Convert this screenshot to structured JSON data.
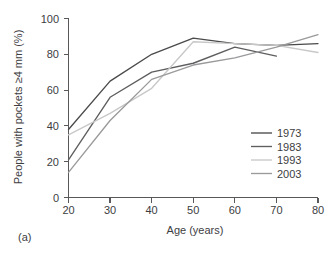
{
  "figure": {
    "panel_label": "(a)"
  },
  "chart_data": {
    "type": "line",
    "title": "",
    "xlabel": "Age (years)",
    "ylabel": "People with pockets ≥4 mm (%)",
    "x": [
      20,
      30,
      40,
      50,
      60,
      70,
      80
    ],
    "xlim": [
      20,
      80
    ],
    "ylim": [
      0,
      100
    ],
    "xticks": [
      20,
      30,
      40,
      50,
      60,
      70,
      80
    ],
    "yticks": [
      0,
      20,
      40,
      60,
      80,
      100
    ],
    "xtick_labels": [
      "20",
      "30",
      "40",
      "50",
      "60",
      "70",
      "80"
    ],
    "ytick_labels": [
      "0",
      "20",
      "40",
      "60",
      "80",
      "100"
    ],
    "grid": false,
    "legend_position": "right-center",
    "series": [
      {
        "name": "1973",
        "color": "#4a4a4c",
        "x": [
          20,
          30,
          40,
          50,
          60,
          70,
          80
        ],
        "values": [
          38,
          65,
          80,
          89,
          86,
          85,
          86
        ]
      },
      {
        "name": "1983",
        "color": "#5e5e60",
        "x": [
          20,
          30,
          40,
          50,
          60,
          70
        ],
        "values": [
          21,
          56,
          70,
          75,
          84,
          79
        ]
      },
      {
        "name": "1993",
        "color": "#c8c8c8",
        "x": [
          20,
          30,
          40,
          50,
          60,
          70,
          80
        ],
        "values": [
          35,
          47,
          61,
          87,
          86,
          85,
          81
        ]
      },
      {
        "name": "2003",
        "color": "#9a9a9c",
        "x": [
          20,
          30,
          40,
          50,
          60,
          70,
          80
        ],
        "values": [
          14,
          43,
          66,
          74,
          78,
          84,
          91
        ]
      }
    ]
  },
  "legend": {
    "items": [
      {
        "label": "1973",
        "color": "#4a4a4c"
      },
      {
        "label": "1983",
        "color": "#5e5e60"
      },
      {
        "label": "1993",
        "color": "#c8c8c8"
      },
      {
        "label": "2003",
        "color": "#9a9a9c"
      }
    ]
  }
}
